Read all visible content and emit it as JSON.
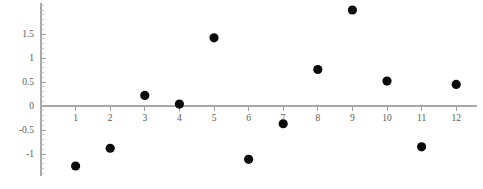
{
  "chart_data": {
    "type": "scatter",
    "title": "",
    "subtitle": "",
    "xlabel": "",
    "ylabel": "",
    "x": [
      1,
      2,
      3,
      4,
      5,
      6,
      7,
      8,
      9,
      10,
      11,
      12
    ],
    "values": [
      -1.25,
      -0.88,
      0.22,
      0.04,
      1.42,
      -1.11,
      -0.37,
      0.76,
      2.0,
      0.52,
      -0.85,
      0.45
    ],
    "series": [
      {
        "name": "",
        "points": [
          {
            "x": 1,
            "y": -1.25
          },
          {
            "x": 2,
            "y": -0.88
          },
          {
            "x": 3,
            "y": 0.22
          },
          {
            "x": 4,
            "y": 0.04
          },
          {
            "x": 5,
            "y": 1.42
          },
          {
            "x": 6,
            "y": -1.11
          },
          {
            "x": 7,
            "y": -0.37
          },
          {
            "x": 8,
            "y": 0.76
          },
          {
            "x": 9,
            "y": 2.0
          },
          {
            "x": 10,
            "y": 0.52
          },
          {
            "x": 11,
            "y": -0.85
          },
          {
            "x": 12,
            "y": 0.45
          }
        ],
        "marker": "filled-circle",
        "color": "#0a0a0a"
      }
    ],
    "xlim": [
      0,
      12.6
    ],
    "ylim": [
      -1.45,
      2.1
    ],
    "xticks": [
      1,
      2,
      3,
      4,
      5,
      6,
      7,
      8,
      9,
      10,
      11,
      12
    ],
    "xtick_labels": [
      "1",
      "2",
      "3",
      "4",
      "5",
      "6",
      "7",
      "8",
      "9",
      "10",
      "11",
      "12"
    ],
    "yticks": [
      -1,
      -0.5,
      0,
      0.5,
      1,
      1.5
    ],
    "ytick_labels": [
      "-1",
      "-0.5",
      "0",
      "0.5",
      "1",
      "1.5"
    ],
    "y_minor_step": 0.1,
    "grid": false,
    "legend": false,
    "legend_position": "none",
    "axis_color": "#a8a8a8",
    "tick_label_color": "#5a5a5a",
    "background_color": "#ffffff",
    "annotations": []
  }
}
